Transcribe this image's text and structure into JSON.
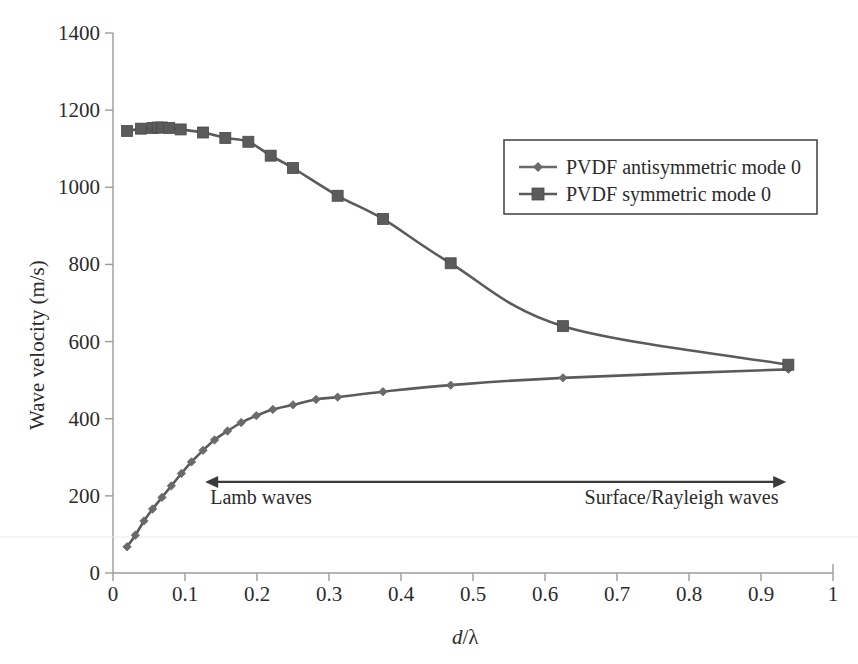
{
  "chart_data": {
    "type": "line",
    "title": "",
    "xlabel": "d/λ",
    "ylabel": "Wave velocity (m/s)",
    "xlim": [
      0,
      1
    ],
    "ylim": [
      0,
      1400
    ],
    "xticks": [
      "0",
      "0.1",
      "0.2",
      "0.3",
      "0.4",
      "0.5",
      "0.6",
      "0.7",
      "0.8",
      "0.9",
      "1"
    ],
    "xtick_values": [
      0,
      0.1,
      0.2,
      0.3,
      0.4,
      0.5,
      0.6,
      0.7,
      0.8,
      0.9,
      1
    ],
    "yticks": [
      "0",
      "200",
      "400",
      "600",
      "800",
      "1000",
      "1200",
      "1400"
    ],
    "ytick_values": [
      0,
      200,
      400,
      600,
      800,
      1000,
      1200,
      1400
    ],
    "grid": false,
    "legend_position": "upper-right",
    "series": [
      {
        "name": "PVDF antisymmetric mode 0",
        "marker": "diamond",
        "color": "#6a6a6a",
        "x": [
          0.0195,
          0.031,
          0.043,
          0.055,
          0.068,
          0.081,
          0.095,
          0.109,
          0.125,
          0.141,
          0.159,
          0.178,
          0.199,
          0.222,
          0.25,
          0.282,
          0.312,
          0.375,
          0.469,
          0.625,
          0.938
        ],
        "y": [
          68,
          98,
          135,
          166,
          196,
          226,
          258,
          288,
          318,
          345,
          368,
          390,
          408,
          424,
          436,
          450,
          456,
          470,
          487,
          506,
          528
        ]
      },
      {
        "name": "PVDF symmetric mode 0",
        "marker": "square",
        "color": "#5b5b5b",
        "x": [
          0.0195,
          0.039,
          0.055,
          0.062,
          0.068,
          0.078,
          0.094,
          0.125,
          0.156,
          0.188,
          0.219,
          0.25,
          0.312,
          0.375,
          0.469,
          0.625,
          0.938
        ],
        "y": [
          1146,
          1152,
          1154,
          1155,
          1155,
          1154,
          1150,
          1142,
          1128,
          1118,
          1082,
          1050,
          978,
          918,
          803,
          640,
          540
        ]
      }
    ],
    "annotations": [
      {
        "name": "range-arrow",
        "type": "double-arrow",
        "x_start": 0.128,
        "x_end": 0.935,
        "y": 236
      },
      {
        "name": "lamb-waves-label",
        "text": "Lamb waves",
        "x": 0.135,
        "y": 178
      },
      {
        "name": "surface-rayleigh-waves-label",
        "text": "Surface/Rayleigh waves",
        "x": 0.655,
        "y": 178
      }
    ],
    "legend": [
      {
        "label": "PVDF antisymmetric mode 0",
        "marker": "diamond",
        "color": "#6a6a6a"
      },
      {
        "label": "PVDF symmetric mode 0",
        "marker": "square",
        "color": "#5b5b5b"
      }
    ]
  },
  "axes": {
    "y_title": "Wave velocity (m/s)",
    "x_title_italic": "d",
    "x_title_rest": "/λ"
  },
  "colors": {
    "axis": "#9b9b9b",
    "series_line": "#5b5b5b",
    "text": "#2b2b2b",
    "legend_border": "#4a4a4a",
    "annotation": "#3a3a3a",
    "background": "#ffffff"
  }
}
